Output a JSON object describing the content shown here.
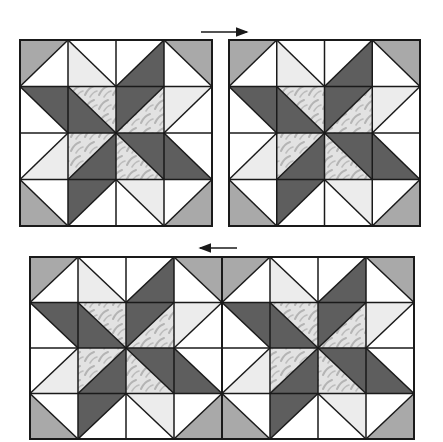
{
  "figure": {
    "colors": {
      "background": "#ffffff",
      "outline": "#1a1a1a",
      "dark": "#5e5e5e",
      "corner": "#a9a9a9",
      "light": "#ececec",
      "white": "#ffffff",
      "print_base": "#e2e2e2",
      "print_motif": "#b4b4b4"
    },
    "arrows": [
      {
        "id": "top-arrow",
        "direction": "right",
        "x1": 201,
        "x2": 247,
        "y": 32
      },
      {
        "id": "bottom-arrow",
        "direction": "left",
        "x1": 200,
        "x2": 237,
        "y": 248
      }
    ],
    "blocks": [
      {
        "id": "block-top-left",
        "x": 20,
        "y": 40,
        "w": 192,
        "h": 186
      },
      {
        "id": "block-top-right",
        "x": 229,
        "y": 40,
        "w": 191,
        "h": 186
      },
      {
        "id": "block-row-left",
        "x": 30,
        "y": 257,
        "w": 192,
        "h": 182
      },
      {
        "id": "block-row-right",
        "x": 222,
        "y": 257,
        "w": 192,
        "h": 182
      }
    ],
    "block_pattern": {
      "grid": 4,
      "pieces": [
        {
          "type": "corner",
          "pts": [
            [
              0,
              0
            ],
            [
              1,
              0
            ],
            [
              0,
              1
            ]
          ]
        },
        {
          "type": "corner",
          "pts": [
            [
              3,
              0
            ],
            [
              4,
              0
            ],
            [
              4,
              1
            ]
          ]
        },
        {
          "type": "corner",
          "pts": [
            [
              0,
              3
            ],
            [
              0,
              4
            ],
            [
              1,
              4
            ]
          ]
        },
        {
          "type": "corner",
          "pts": [
            [
              4,
              3
            ],
            [
              4,
              4
            ],
            [
              3,
              4
            ]
          ]
        },
        {
          "type": "dark",
          "pts": [
            [
              0,
              1
            ],
            [
              1,
              1
            ],
            [
              2,
              2
            ],
            [
              1,
              2
            ]
          ]
        },
        {
          "type": "dark",
          "pts": [
            [
              3,
              0
            ],
            [
              3,
              1
            ],
            [
              2,
              2
            ],
            [
              2,
              1
            ]
          ]
        },
        {
          "type": "dark",
          "pts": [
            [
              2,
              2
            ],
            [
              3,
              2
            ],
            [
              4,
              3
            ],
            [
              3,
              3
            ]
          ]
        },
        {
          "type": "dark",
          "pts": [
            [
              2,
              2
            ],
            [
              2,
              3
            ],
            [
              1,
              4
            ],
            [
              1,
              3
            ]
          ]
        },
        {
          "type": "print",
          "pts": [
            [
              1,
              1
            ],
            [
              2,
              1
            ],
            [
              2,
              2
            ]
          ]
        },
        {
          "type": "print",
          "pts": [
            [
              2,
              2
            ],
            [
              3,
              1
            ],
            [
              3,
              2
            ]
          ]
        },
        {
          "type": "print",
          "pts": [
            [
              1,
              2
            ],
            [
              2,
              2
            ],
            [
              1,
              3
            ]
          ]
        },
        {
          "type": "print",
          "pts": [
            [
              2,
              2
            ],
            [
              2,
              3
            ],
            [
              3,
              3
            ]
          ]
        },
        {
          "type": "light",
          "pts": [
            [
              1,
              0
            ],
            [
              2,
              1
            ],
            [
              1,
              1
            ]
          ]
        },
        {
          "type": "light",
          "pts": [
            [
              4,
              1
            ],
            [
              3,
              2
            ],
            [
              3,
              1
            ]
          ]
        },
        {
          "type": "light",
          "pts": [
            [
              1,
              2
            ],
            [
              0,
              3
            ],
            [
              1,
              3
            ]
          ]
        },
        {
          "type": "light",
          "pts": [
            [
              2,
              3
            ],
            [
              3,
              4
            ],
            [
              3,
              3
            ]
          ]
        }
      ],
      "seams": [
        [
          [
            1,
            0
          ],
          [
            1,
            4
          ]
        ],
        [
          [
            2,
            0
          ],
          [
            2,
            4
          ]
        ],
        [
          [
            3,
            0
          ],
          [
            3,
            4
          ]
        ],
        [
          [
            0,
            1
          ],
          [
            4,
            1
          ]
        ],
        [
          [
            0,
            2
          ],
          [
            4,
            2
          ]
        ],
        [
          [
            0,
            3
          ],
          [
            4,
            3
          ]
        ],
        [
          [
            1,
            0
          ],
          [
            0,
            1
          ]
        ],
        [
          [
            3,
            0
          ],
          [
            4,
            1
          ]
        ],
        [
          [
            0,
            3
          ],
          [
            1,
            4
          ]
        ],
        [
          [
            4,
            3
          ],
          [
            3,
            4
          ]
        ],
        [
          [
            1,
            0
          ],
          [
            2,
            1
          ]
        ],
        [
          [
            4,
            1
          ],
          [
            3,
            2
          ]
        ],
        [
          [
            1,
            2
          ],
          [
            0,
            3
          ]
        ],
        [
          [
            2,
            3
          ],
          [
            3,
            4
          ]
        ],
        [
          [
            0,
            1
          ],
          [
            1,
            2
          ]
        ],
        [
          [
            1,
            1
          ],
          [
            2,
            2
          ]
        ],
        [
          [
            2,
            2
          ],
          [
            3,
            3
          ]
        ],
        [
          [
            3,
            2
          ],
          [
            4,
            3
          ]
        ],
        [
          [
            3,
            0
          ],
          [
            2,
            1
          ]
        ],
        [
          [
            3,
            1
          ],
          [
            2,
            2
          ]
        ],
        [
          [
            2,
            2
          ],
          [
            1,
            3
          ]
        ],
        [
          [
            2,
            3
          ],
          [
            1,
            4
          ]
        ]
      ]
    }
  }
}
